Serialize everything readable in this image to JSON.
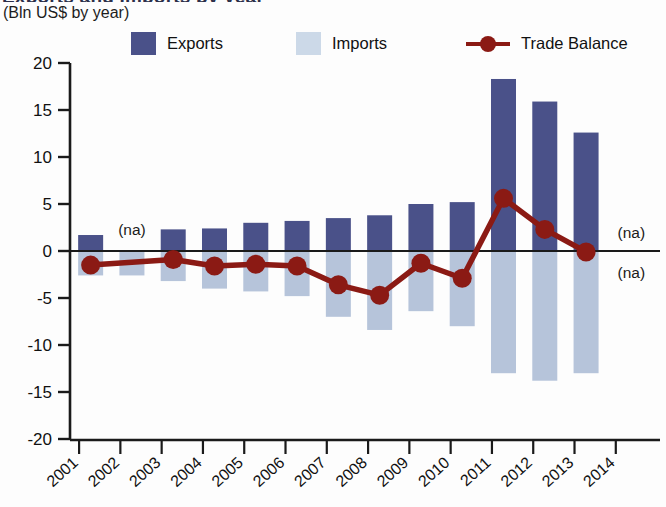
{
  "header": {
    "title_clipped": "Exports and Imports by year",
    "subtitle": "(Bln US$ by year)"
  },
  "legend": {
    "exports_label": "Exports",
    "imports_label": "Imports",
    "balance_label": "Trade Balance"
  },
  "colors": {
    "exports": "#4a5189",
    "imports": "#b6c4da",
    "balance": "#8b1a14",
    "axis": "#1a1a1a",
    "text": "#111111"
  },
  "annotations": {
    "na_2002_exports": "(na)",
    "na_2014_exports": "(na)",
    "na_2014_imports": "(na)"
  },
  "chart_data": {
    "type": "bar",
    "title": "Exports and Imports by year",
    "subtitle": "(Bln US$ by year)",
    "xlabel": "",
    "ylabel": "Bln US$",
    "ylim": [
      -20,
      20
    ],
    "yticks": [
      20,
      15,
      10,
      5,
      0,
      -5,
      -10,
      -15,
      -20
    ],
    "ytick_labels": [
      "20",
      "15",
      "10",
      "5",
      "0",
      "-5",
      "-10",
      "-15",
      "-20"
    ],
    "grid": false,
    "legend_position": "top",
    "categories": [
      "2001",
      "2002",
      "2003",
      "2004",
      "2005",
      "2006",
      "2007",
      "2008",
      "2009",
      "2010",
      "2011",
      "2012",
      "2013",
      "2014"
    ],
    "series": [
      {
        "name": "Exports",
        "type": "bar",
        "color": "#4a5189",
        "values": [
          1.7,
          null,
          2.3,
          2.4,
          3.0,
          3.2,
          3.5,
          3.8,
          5.0,
          5.2,
          18.3,
          15.9,
          12.6,
          null
        ]
      },
      {
        "name": "Imports",
        "type": "bar",
        "color": "#b6c4da",
        "values": [
          -2.6,
          -2.6,
          -3.2,
          -4.0,
          -4.3,
          -4.8,
          -7.0,
          -8.4,
          -6.4,
          -8.0,
          -13.0,
          -13.8,
          -13.0,
          null
        ]
      },
      {
        "name": "Trade Balance",
        "type": "line",
        "color": "#8b1a14",
        "values": [
          -1.5,
          null,
          -0.9,
          -1.6,
          -1.4,
          -1.6,
          -3.6,
          -4.7,
          -1.3,
          -2.9,
          5.6,
          2.3,
          -0.1,
          null
        ]
      }
    ]
  }
}
